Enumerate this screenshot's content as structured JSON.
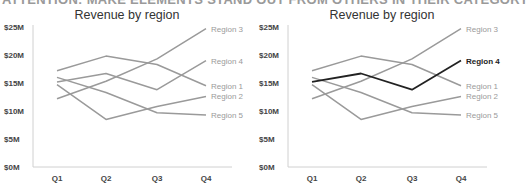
{
  "banner": "ATTENTION: MAKE ELEMENTS STAND OUT FROM OTHERS IN THEIR CATEGORY",
  "colors": {
    "muted": "#9a9a9a",
    "highlight": "#222222",
    "axis": "#d0d0d0",
    "text": "#444444"
  },
  "chart_data": [
    {
      "type": "line",
      "title": "Revenue by region",
      "categories": [
        "Q1",
        "Q2",
        "Q3",
        "Q4"
      ],
      "ylabel": "",
      "xlabel": "",
      "yticks": [
        "$0M",
        "$5M",
        "$10M",
        "$15M",
        "$20M",
        "$25M"
      ],
      "ylim": [
        0,
        25
      ],
      "grid": false,
      "legend_position": "direct-labels-right",
      "highlight": null,
      "series": [
        {
          "name": "Region 1",
          "values": [
            17.2,
            19.8,
            18.3,
            14.5
          ]
        },
        {
          "name": "Region 2",
          "values": [
            14.7,
            8.5,
            10.8,
            12.6
          ]
        },
        {
          "name": "Region 3",
          "values": [
            12.2,
            15.3,
            19.3,
            24.7
          ]
        },
        {
          "name": "Region 4",
          "values": [
            15.2,
            16.7,
            13.8,
            19.0
          ]
        },
        {
          "name": "Region 5",
          "values": [
            16.0,
            13.3,
            9.7,
            9.3
          ]
        }
      ]
    },
    {
      "type": "line",
      "title": "Revenue by region",
      "categories": [
        "Q1",
        "Q2",
        "Q3",
        "Q4"
      ],
      "ylabel": "",
      "xlabel": "",
      "yticks": [
        "$0M",
        "$5M",
        "$10M",
        "$15M",
        "$20M",
        "$25M"
      ],
      "ylim": [
        0,
        25
      ],
      "grid": false,
      "legend_position": "direct-labels-right",
      "highlight": "Region 4",
      "series": [
        {
          "name": "Region 1",
          "values": [
            17.2,
            19.8,
            18.3,
            14.5
          ]
        },
        {
          "name": "Region 2",
          "values": [
            14.7,
            8.5,
            10.8,
            12.6
          ]
        },
        {
          "name": "Region 3",
          "values": [
            12.2,
            15.3,
            19.3,
            24.7
          ]
        },
        {
          "name": "Region 4",
          "values": [
            15.2,
            16.7,
            13.8,
            19.0
          ]
        },
        {
          "name": "Region 5",
          "values": [
            16.0,
            13.3,
            9.7,
            9.3
          ]
        }
      ]
    }
  ]
}
